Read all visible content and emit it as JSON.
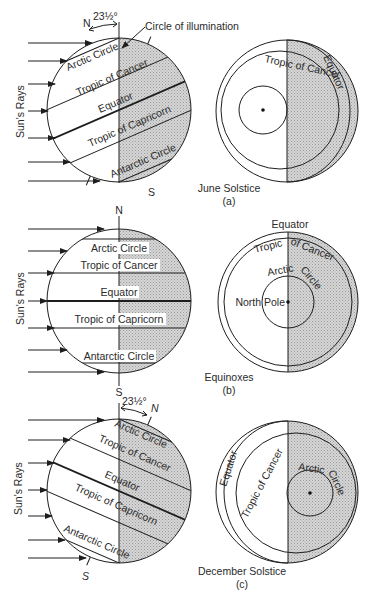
{
  "figure": {
    "panels": [
      {
        "id": "a",
        "title": "June Solstice",
        "letter": "(a)",
        "side_view": {
          "rays_label": "Sun's Rays",
          "north_label": "N",
          "south_label": "S",
          "tilt_label": "23½°",
          "illumination_label": "Circle of illumination",
          "parallels": [
            "Arctic Circle",
            "Tropic of Cancer",
            "Equator",
            "Tropic of Capricorn",
            "Antarctic Circle"
          ]
        },
        "polar_view": {
          "labels": [
            "Tropic of Cancer",
            "Equator"
          ]
        }
      },
      {
        "id": "b",
        "title": "Equinoxes",
        "letter": "(b)",
        "side_view": {
          "rays_label": "Sun's Rays",
          "north_label": "N",
          "south_label": "S",
          "parallels": [
            "Arctic Circle",
            "Tropic of Cancer",
            "Equator",
            "Tropic of Capricorn",
            "Antarctic Circle"
          ]
        },
        "polar_view": {
          "labels": [
            "Equator",
            "Tropic of Cancer",
            "Arctic Circle",
            "North Pole"
          ]
        }
      },
      {
        "id": "c",
        "title": "December Solstice",
        "letter": "(c)",
        "side_view": {
          "rays_label": "Sun's Rays",
          "north_label": "N",
          "south_label": "S",
          "tilt_label": "23½°",
          "parallels": [
            "Arctic Circle",
            "Tropic of Cancer",
            "Equator",
            "Tropic of Capricorn",
            "Antarctic Circle"
          ]
        },
        "polar_view": {
          "labels": [
            "Equator",
            "Tropic of Cancer",
            "Arctic Circle"
          ]
        }
      }
    ],
    "colors": {
      "line": "#1e1e1e",
      "shade": "#c9c9c9",
      "text": "#2a2a2a",
      "background": "#ffffff"
    }
  }
}
